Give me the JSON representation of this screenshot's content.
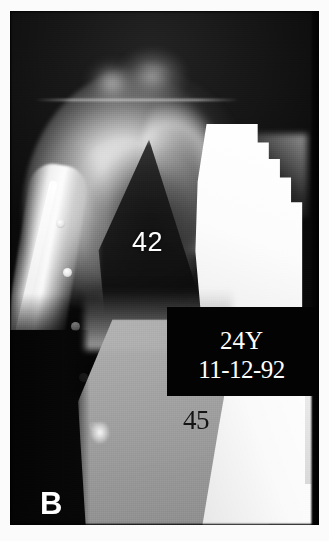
{
  "figure": {
    "kind": "radiograph",
    "panel_letter": "B",
    "background_color": "#050505",
    "plate_border_color": "#fbfbfb"
  },
  "annotations": {
    "measurement_upper": "42",
    "measurement_lower": "45",
    "measurement_upper_color": "#ffffff",
    "measurement_lower_color": "#141414"
  },
  "info_box": {
    "age": "24Y",
    "date": "11-12-92",
    "background_color": "#030303",
    "text_color": "#ffffff"
  }
}
